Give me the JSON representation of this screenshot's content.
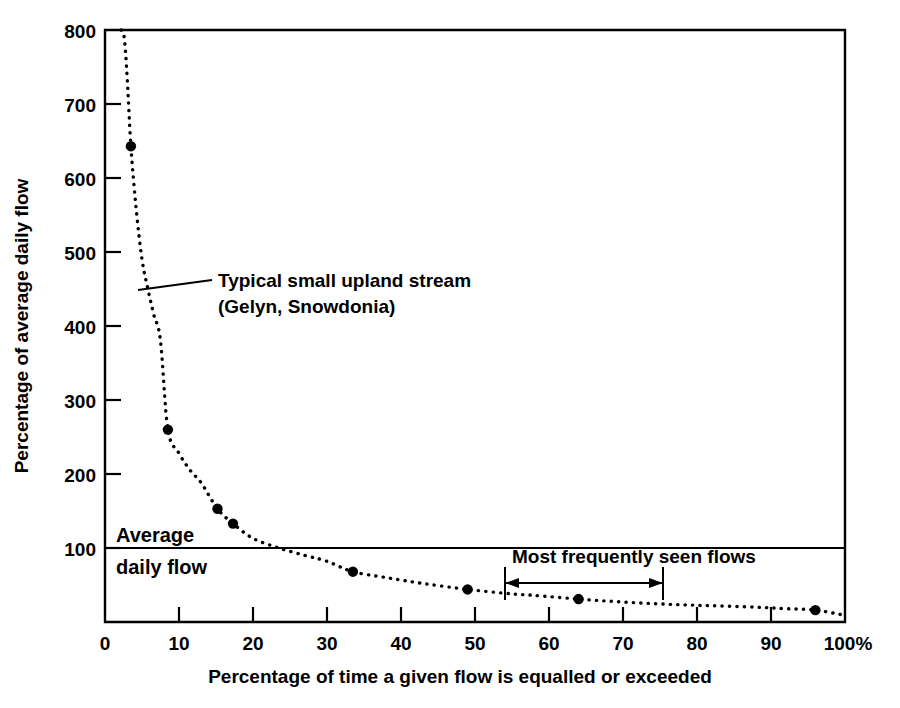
{
  "figure": {
    "background_color": "#ffffff",
    "ink_color": "#000000"
  },
  "axes": {
    "x_title": "Percentage of time a given flow is equalled or exceeded",
    "y_title": "Percentage of average daily flow",
    "x_ticks": [
      "0",
      "10",
      "20",
      "30",
      "40",
      "50",
      "60",
      "70",
      "80",
      "90",
      "100%"
    ],
    "x_tick_values": [
      0,
      10,
      20,
      30,
      40,
      50,
      60,
      70,
      80,
      90,
      100
    ],
    "y_ticks": [
      "100",
      "200",
      "300",
      "400",
      "500",
      "600",
      "700",
      "800"
    ],
    "y_tick_values": [
      100,
      200,
      300,
      400,
      500,
      600,
      700,
      800
    ],
    "y_origin_label": "0"
  },
  "annotations": {
    "curve_label_line1": "Typical small upland stream",
    "curve_label_line2": "(Gelyn, Snowdonia)",
    "average_line1": "Average",
    "average_line2": "daily flow",
    "average_value": 100,
    "span_label": "Most frequently seen flows",
    "span_start": 54,
    "span_end": 75
  },
  "chart_data": {
    "type": "line",
    "title": "",
    "subtitle": "",
    "xlabel": "Percentage of time a given flow is equalled or exceeded",
    "ylabel": "Percentage of average daily flow",
    "xlim": [
      0,
      100
    ],
    "ylim": [
      0,
      800
    ],
    "grid": false,
    "legend": "none",
    "line_style": "dotted",
    "series": [
      {
        "name": "Typical small upland stream (Gelyn, Snowdonia)",
        "style": "dotted",
        "x": [
          2.2,
          2.6,
          3.0,
          3.5,
          4.2,
          5.0,
          5.8,
          6.6,
          7.5,
          8.5,
          10.0,
          11.5,
          13.0,
          15.2,
          17.3,
          20.0,
          23.5,
          27.0,
          30.0,
          33.5,
          38.0,
          43.0,
          49.0,
          55.0,
          58.0,
          64.0,
          70.0,
          76.0,
          82.0,
          88.0,
          92.0,
          96.0,
          100.0
        ],
        "y": [
          830,
          790,
          735,
          643,
          560,
          490,
          450,
          415,
          380,
          260,
          228,
          205,
          188,
          153,
          133,
          113,
          100,
          90,
          82,
          68,
          60,
          52,
          44,
          38,
          36,
          31,
          27,
          24,
          22,
          20,
          18,
          16,
          9
        ],
        "markers": [
          {
            "x": 3.5,
            "y": 643
          },
          {
            "x": 8.5,
            "y": 260
          },
          {
            "x": 15.2,
            "y": 153
          },
          {
            "x": 17.3,
            "y": 133
          },
          {
            "x": 33.5,
            "y": 68
          },
          {
            "x": 49.0,
            "y": 44
          },
          {
            "x": 64.0,
            "y": 31
          },
          {
            "x": 96.0,
            "y": 16
          }
        ]
      }
    ],
    "reference_lines": [
      {
        "name": "Average daily flow",
        "axis": "y",
        "value": 100
      }
    ],
    "span_markers": [
      {
        "label": "Most frequently seen flows",
        "axis": "x",
        "from": 54,
        "to": 75
      }
    ]
  }
}
